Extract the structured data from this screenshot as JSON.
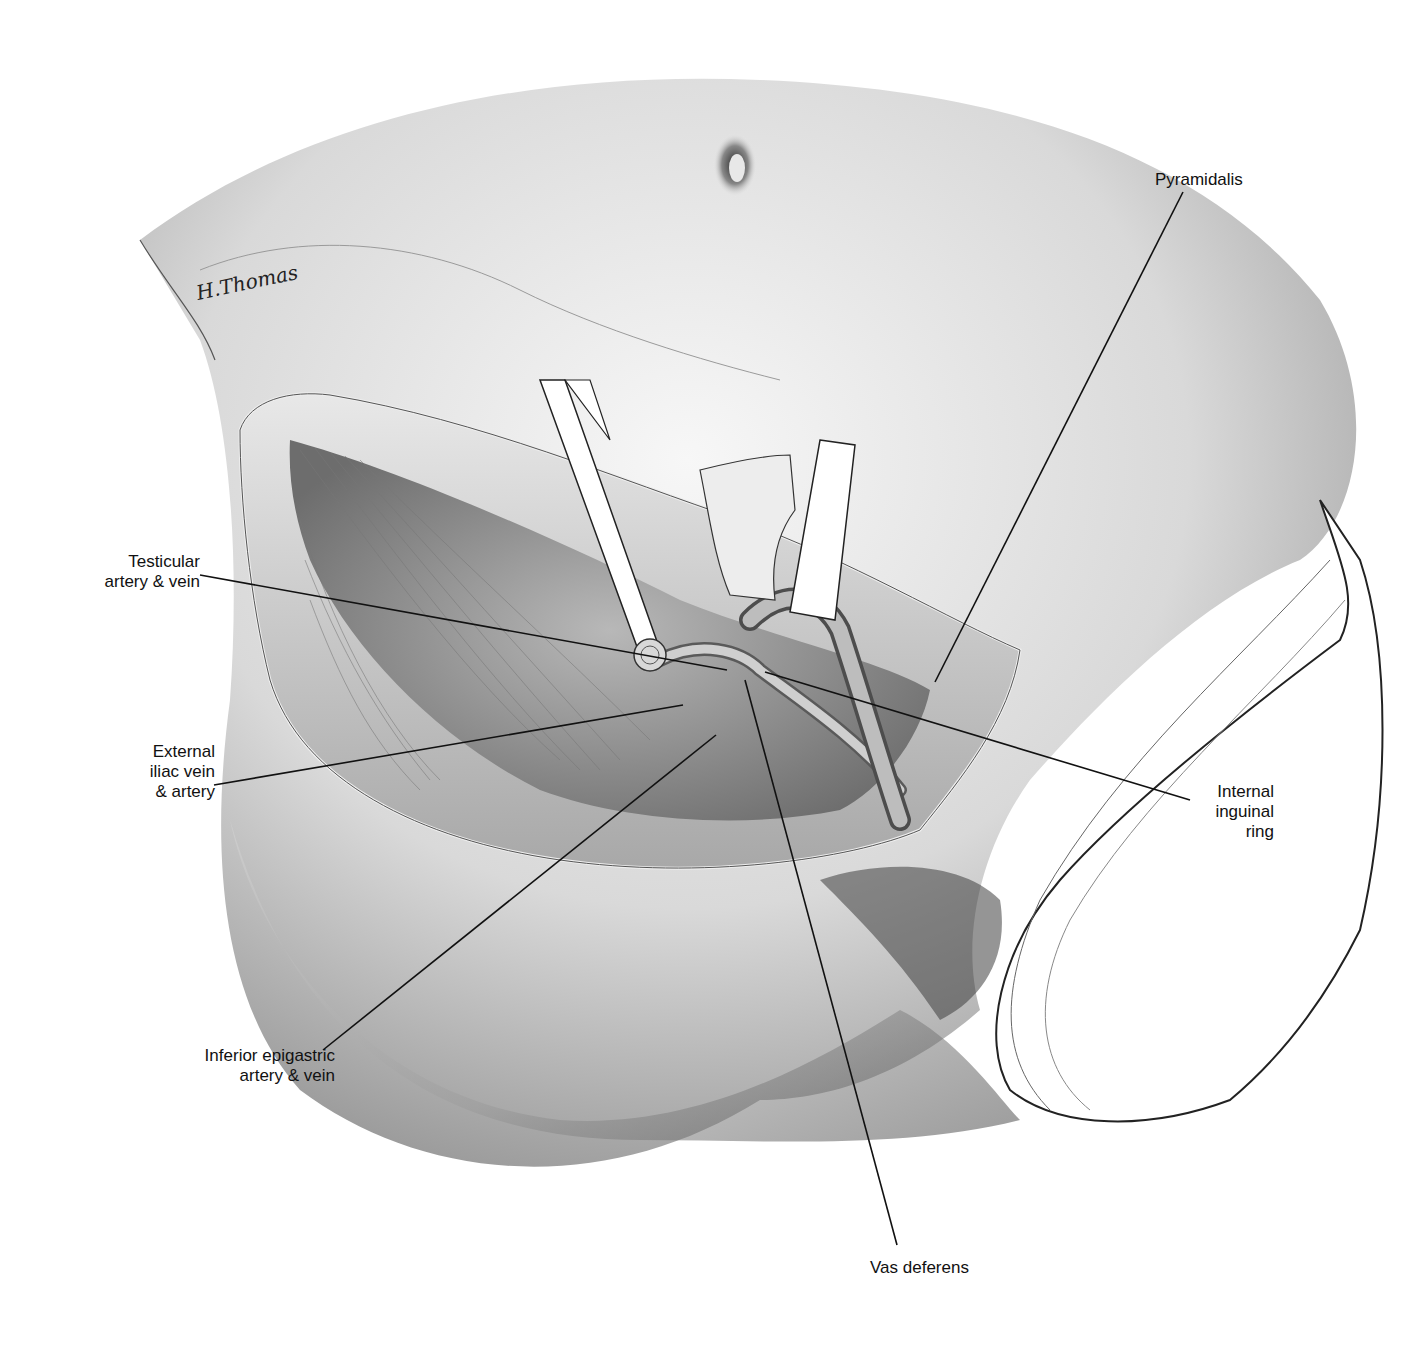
{
  "figure": {
    "type": "surgical-anatomical-illustration",
    "signature": "H.Thomas",
    "colors": {
      "ink": "#111111",
      "skin_light": "#eeeeee",
      "skin_mid": "#bdbdbd",
      "skin_dark": "#555555",
      "drape": "#ffffff"
    }
  },
  "labels": [
    {
      "id": "testicular",
      "text": "Testicular\nartery & vein",
      "x": 60,
      "y": 552,
      "w": 140,
      "align": "right",
      "line": {
        "x1": 200,
        "y1": 575,
        "x2": 727,
        "y2": 670
      }
    },
    {
      "id": "external-iliac",
      "text": "External\niliac vein\n& artery",
      "x": 100,
      "y": 742,
      "w": 115,
      "align": "right",
      "line": {
        "x1": 214,
        "y1": 785,
        "x2": 683,
        "y2": 705
      }
    },
    {
      "id": "inferior-epigastric",
      "text": "Inferior epigastric\nartery & vein",
      "x": 150,
      "y": 1046,
      "w": 185,
      "align": "right",
      "line": {
        "x1": 323,
        "y1": 1050,
        "x2": 716,
        "y2": 735
      }
    },
    {
      "id": "vas-deferens",
      "text": "Vas deferens",
      "x": 870,
      "y": 1258,
      "w": 130,
      "align": "left",
      "line": {
        "x1": 897,
        "y1": 1245,
        "x2": 745,
        "y2": 680
      }
    },
    {
      "id": "internal-inguinal-ring",
      "text": "Internal\ninguinal\nring",
      "x": 1170,
      "y": 782,
      "w": 104,
      "align": "right",
      "line": {
        "x1": 1190,
        "y1": 800,
        "x2": 765,
        "y2": 672
      }
    },
    {
      "id": "pyramidalis",
      "text": "Pyramidalis",
      "x": 1155,
      "y": 170,
      "w": 120,
      "align": "left",
      "line": {
        "x1": 1183,
        "y1": 192,
        "x2": 935,
        "y2": 682
      }
    }
  ]
}
